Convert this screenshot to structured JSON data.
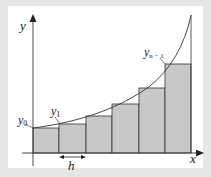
{
  "diagram": {
    "axes": {
      "x_label": "x",
      "y_label": "y"
    },
    "point_labels": {
      "y0": {
        "base": "y",
        "sub": "0"
      },
      "y1": {
        "base": "y",
        "sub": "1"
      },
      "yn1": {
        "base": "y",
        "sub": "n − 1"
      }
    },
    "width_label": "h",
    "rectangles": [
      {
        "x": 33,
        "w": 26,
        "top": 128
      },
      {
        "x": 59,
        "w": 27,
        "top": 124
      },
      {
        "x": 86,
        "w": 26,
        "top": 116
      },
      {
        "x": 112,
        "w": 27,
        "top": 104
      },
      {
        "x": 139,
        "w": 26,
        "top": 88
      },
      {
        "x": 165,
        "w": 26,
        "top": 64
      }
    ],
    "colors": {
      "frame": "#e6e6e6",
      "fill": "#c8c8c8",
      "stroke": "#333333"
    }
  }
}
